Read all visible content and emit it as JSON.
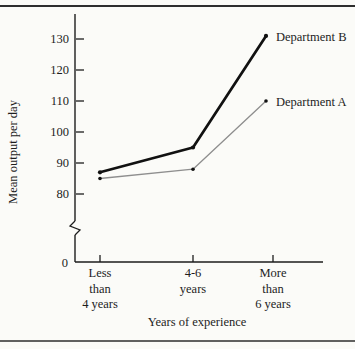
{
  "page": {
    "background": "#fbfbf8",
    "rule_color": "#2e2e2e",
    "text_color": "#1d1d1d"
  },
  "chart_data": {
    "type": "line",
    "title": "",
    "xlabel": "Years of experience",
    "ylabel": "Mean output per day",
    "categories": [
      [
        "Less",
        "than",
        "4 years"
      ],
      [
        "4-6",
        "years"
      ],
      [
        "More",
        "than",
        "6 years"
      ]
    ],
    "series": [
      {
        "name": "Department A",
        "values": [
          85,
          88,
          110
        ],
        "color": "#8e8e8e",
        "line_width": 1.3,
        "marker_color": "#111111"
      },
      {
        "name": "Department B",
        "values": [
          87,
          95,
          131
        ],
        "color": "#111111",
        "line_width": 2.7,
        "marker_color": "#111111"
      }
    ],
    "y_ticks": [
      130,
      120,
      110,
      100,
      90,
      80
    ],
    "origin_label": "0",
    "axis_break": true,
    "ylim": [
      0,
      135
    ],
    "legend_position": "right-of-last-point",
    "grid": false
  }
}
